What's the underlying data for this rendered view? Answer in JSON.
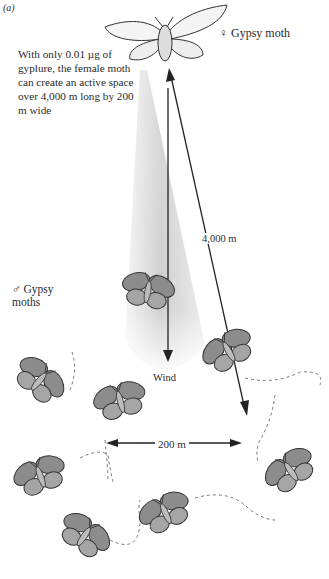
{
  "figure": {
    "panel_label": "(a)",
    "caption": "With only 0.01 µg of gyplure, the female moth can create an active space over 4,000 m long by 200 m wide",
    "female_label": "♀ Gypsy moth",
    "male_label": "♂ Gypsy moths",
    "distance_label": "4,000 m",
    "wind_label": "Wind",
    "width_label": "200 m",
    "colors": {
      "ink": "#2a2a2a",
      "plume_light": "#f2f2f2",
      "plume_dark": "#cfcfcf",
      "moth_wing": "#8a8a8a"
    },
    "elements": {
      "female_moth": {
        "x": 165,
        "y": 35,
        "role": "pheromone source"
      },
      "male_moths": [
        {
          "x": 148,
          "y": 290,
          "rot": 10
        },
        {
          "x": 228,
          "y": 350,
          "rot": -30
        },
        {
          "x": 40,
          "y": 380,
          "rot": 40
        },
        {
          "x": 120,
          "y": 400,
          "rot": -15
        },
        {
          "x": 40,
          "y": 475,
          "rot": -20
        },
        {
          "x": 290,
          "y": 470,
          "rot": -35
        },
        {
          "x": 165,
          "y": 512,
          "rot": -25
        },
        {
          "x": 85,
          "y": 535,
          "rot": 35
        }
      ]
    }
  }
}
